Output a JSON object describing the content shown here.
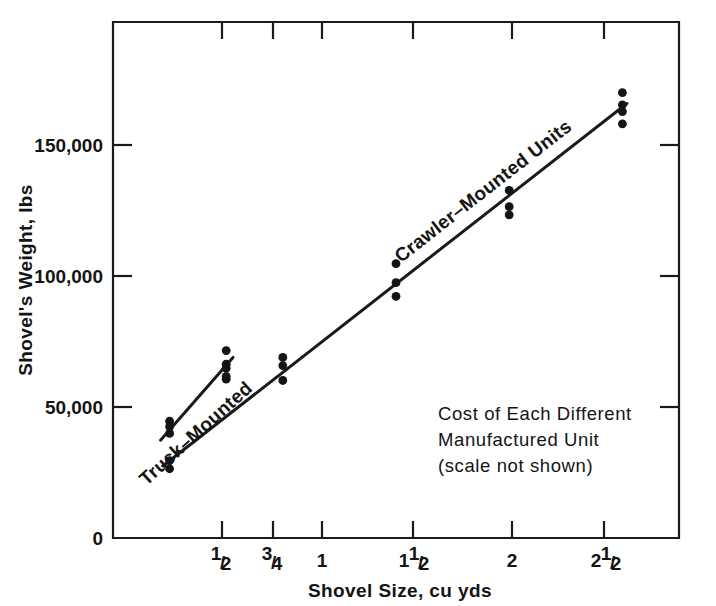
{
  "chart_data": {
    "type": "scatter",
    "title": "",
    "xlabel": "Shovel Size, cu yds",
    "ylabel": "Shovel's Weight, lbs",
    "xlim": [
      0.25,
      2.75
    ],
    "ylim": [
      0,
      190000
    ],
    "grid": false,
    "legend_position": "inline-annotations",
    "x_tick_values": [
      0.5,
      0.75,
      1.0,
      1.5,
      2.0,
      2.5
    ],
    "x_tick_labels": [
      "1/2",
      "3/4",
      "1",
      "1 1/2",
      "2",
      "2 1/2"
    ],
    "x_tick_parts": [
      {
        "whole": "",
        "num": "1",
        "den": "2"
      },
      {
        "whole": "",
        "num": "3",
        "den": "4"
      },
      {
        "whole": "1",
        "num": "",
        "den": ""
      },
      {
        "whole": "1",
        "num": "1",
        "den": "2"
      },
      {
        "whole": "2",
        "num": "",
        "den": ""
      },
      {
        "whole": "2",
        "num": "1",
        "den": "2"
      }
    ],
    "y_tick_values": [
      0,
      50000,
      100000,
      150000
    ],
    "y_tick_labels": [
      "0",
      "50,000",
      "100,000",
      "150,000"
    ],
    "series": [
      {
        "name": "Truck-Mounted",
        "label": "Truck–Mounted",
        "marker": "filled-circle",
        "points": [
          {
            "x": 0.5,
            "y": 43000
          },
          {
            "x": 0.5,
            "y": 41000
          },
          {
            "x": 0.5,
            "y": 38500
          },
          {
            "x": 0.75,
            "y": 69000
          },
          {
            "x": 0.75,
            "y": 64000
          },
          {
            "x": 0.75,
            "y": 59500
          }
        ],
        "fit_line": {
          "x0": 0.46,
          "y0": 36000,
          "x1": 0.78,
          "y1": 66500
        }
      },
      {
        "name": "Crawler-Mounted Units",
        "label": "Crawler–Mounted Units",
        "marker": "filled-circle",
        "points": [
          {
            "x": 0.5,
            "y": 28500
          },
          {
            "x": 0.5,
            "y": 25500
          },
          {
            "x": 0.75,
            "y": 62500
          },
          {
            "x": 0.75,
            "y": 58500
          },
          {
            "x": 1.0,
            "y": 66500
          },
          {
            "x": 1.0,
            "y": 63500
          },
          {
            "x": 1.0,
            "y": 58000
          },
          {
            "x": 1.5,
            "y": 101000
          },
          {
            "x": 1.5,
            "y": 94000
          },
          {
            "x": 1.5,
            "y": 89000
          },
          {
            "x": 2.0,
            "y": 128000
          },
          {
            "x": 2.0,
            "y": 122000
          },
          {
            "x": 2.0,
            "y": 119000
          },
          {
            "x": 2.5,
            "y": 164000
          },
          {
            "x": 2.5,
            "y": 159500
          },
          {
            "x": 2.5,
            "y": 157000
          },
          {
            "x": 2.5,
            "y": 152500
          }
        ],
        "fit_line": {
          "x0": 0.47,
          "y0": 26500,
          "x1": 2.52,
          "y1": 160000
        }
      }
    ],
    "annotations": [
      {
        "name": "cost-note",
        "lines": [
          "Cost of Each Different",
          "Manufactured Unit",
          "(scale not shown)"
        ]
      }
    ]
  },
  "colors": {
    "ink": "#141414",
    "axis": "#1a1a1a",
    "background": "#ffffff"
  }
}
